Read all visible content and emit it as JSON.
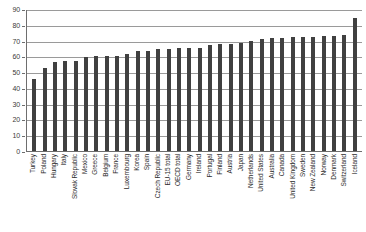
{
  "chart_data": {
    "type": "bar",
    "title": "",
    "subtitle": "",
    "xlabel": "",
    "ylabel": "",
    "ylim": [
      0,
      90
    ],
    "ytick_step": 10,
    "grid": true,
    "legend": false,
    "bar_color": "#404040",
    "axis_color": "#6e6e6e",
    "grid_color": "#9a9a9a",
    "yticks": [
      "90",
      "80",
      "70",
      "60",
      "50",
      "40",
      "30",
      "20",
      "10",
      "0"
    ],
    "categories": [
      "Turkey",
      "Poland",
      "Hungary",
      "Italy",
      "Slovak Republic",
      "Mexico",
      "Greece",
      "Belgium",
      "France",
      "Luxembourg",
      "Korea",
      "Spain",
      "Czech Republic",
      "EU-15 total",
      "OECD total",
      "Germany",
      "Ireland",
      "Portugal",
      "Finland",
      "Austria",
      "Japan",
      "Netherlands",
      "United States",
      "Australia",
      "Canada",
      "United Kingdom",
      "Sweden",
      "New Zealand",
      "Norway",
      "Denmark",
      "Switzerland",
      "Iceland"
    ],
    "values": [
      45.7,
      52.8,
      56.4,
      57.3,
      57.3,
      59.3,
      60.1,
      60.2,
      60.5,
      61.4,
      63.4,
      63.6,
      64.7,
      64.9,
      65.2,
      65.4,
      65.6,
      67.5,
      67.8,
      68.0,
      68.3,
      69.5,
      71.2,
      71.5,
      71.6,
      72.0,
      72.3,
      72.5,
      72.7,
      72.9,
      73.5,
      84.6
    ]
  }
}
